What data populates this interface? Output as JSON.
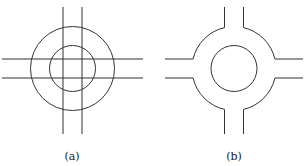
{
  "figures": [
    {
      "id": "a",
      "label": "(a)",
      "description": "Crossing roads overlapping a roundabout: two concentric circles with two vertical and two horizontal straight lines passing through",
      "center": [
        72.5,
        68.5
      ],
      "outer_radius": 42,
      "inner_radius": 23,
      "vertical_lines_x": [
        63,
        82
      ],
      "horizontal_lines_y": [
        59,
        78
      ],
      "line_extent": {
        "x": [
          2,
          143
        ],
        "y": [
          7,
          134
        ]
      }
    },
    {
      "id": "b",
      "label": "(b)",
      "description": "Trimmed roundabout: inner circle island with four road arms connected to outer ring arcs",
      "center": [
        234,
        68.5
      ],
      "outer_radius": 42,
      "inner_radius": 23,
      "road_half_width": 9.5,
      "arm_extent": {
        "x": [
          165,
          303
        ],
        "y": [
          7,
          134
        ]
      }
    }
  ],
  "style": {
    "stroke": "#333333",
    "background": "#ffffff"
  }
}
